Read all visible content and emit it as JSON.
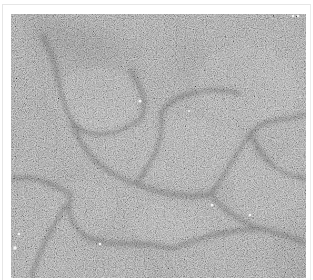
{
  "image": {
    "kind": "grayscale micrograph",
    "description": "Noisy gray texture with darker curved boundaries outlining polygonal cell-like regions and scattered bright specks",
    "colors": {
      "background": "#ffffff",
      "frame_border": "#e6e6e6",
      "base_gray": "#6e6e6e",
      "boundary_dark": "#3c3c3c",
      "speck": "#f4f4f4"
    },
    "specks": [
      {
        "x": 129,
        "y": 87,
        "r": 1.6
      },
      {
        "x": 178,
        "y": 97,
        "r": 1.0
      },
      {
        "x": 201,
        "y": 191,
        "r": 1.3
      },
      {
        "x": 239,
        "y": 201,
        "r": 1.3
      },
      {
        "x": 89,
        "y": 230,
        "r": 1.3
      },
      {
        "x": 4,
        "y": 234,
        "r": 1.8
      },
      {
        "x": 8,
        "y": 220,
        "r": 1.2
      },
      {
        "x": 282,
        "y": 2,
        "r": 1.2
      },
      {
        "x": 287,
        "y": 2,
        "r": 1.2
      },
      {
        "x": 289,
        "y": 83,
        "r": 0.8
      }
    ]
  }
}
